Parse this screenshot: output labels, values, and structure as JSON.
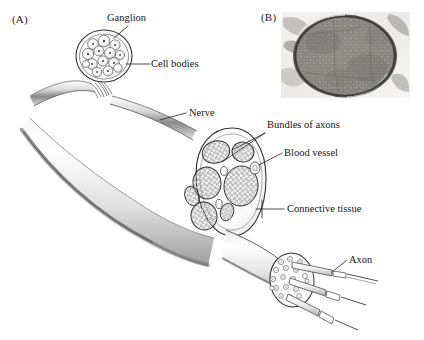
{
  "figure": {
    "width": 424,
    "height": 340,
    "background_color": "#ffffff",
    "ink_color": "#1a1a1a"
  },
  "panels": [
    {
      "id": "A",
      "letter": "(A)",
      "type": "line-drawing",
      "description": "Schematic drawing of a peripheral nerve with an attached ganglion, cut away to show fascicles of axons"
    },
    {
      "id": "B",
      "letter": "(B)",
      "type": "micrograph",
      "description": "Light micrograph of a nerve in cross-section showing densely packed myelinated axon profiles"
    }
  ],
  "labels": {
    "ganglion": "Ganglion",
    "cell_bodies": "Cell bodies",
    "nerve": "Nerve",
    "bundles_of_axons": "Bundles of axons",
    "blood_vessel": "Blood vessel",
    "connective_tissue": "Connective tissue",
    "axon": "Axon"
  },
  "colors": {
    "ink": "#1a1a1a",
    "line": "#2b2b2b",
    "shade_dark": "#6f6f6f",
    "shade_mid": "#a9a9a9",
    "shade_light": "#d8d8d8",
    "fill_white": "#ffffff",
    "micrograph_tissue": "#8c8a86",
    "micrograph_background": "#f2f1ef"
  },
  "structures": {
    "fascicle_count_main": 7,
    "cell_body_count_ganglion": 14,
    "axon_callout_count": 3
  }
}
